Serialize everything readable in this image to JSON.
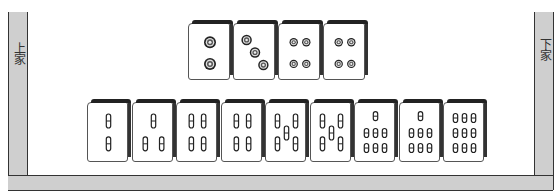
{
  "seats": {
    "left_label": "上家",
    "right_label": "下家"
  },
  "melded_tiles": [
    {
      "suit": "dots",
      "rank": 2
    },
    {
      "suit": "dots",
      "rank": 3
    },
    {
      "suit": "dots",
      "rank": 4
    },
    {
      "suit": "dots",
      "rank": 4
    }
  ],
  "hand_tiles": [
    {
      "suit": "bamboo",
      "rank": 2
    },
    {
      "suit": "bamboo",
      "rank": 3
    },
    {
      "suit": "bamboo",
      "rank": 4
    },
    {
      "suit": "bamboo",
      "rank": 4
    },
    {
      "suit": "bamboo",
      "rank": 5
    },
    {
      "suit": "bamboo",
      "rank": 5
    },
    {
      "suit": "bamboo",
      "rank": 7
    },
    {
      "suit": "bamboo",
      "rank": 7
    },
    {
      "suit": "bamboo",
      "rank": 9
    }
  ],
  "colors": {
    "frame": "#cfcfcf",
    "tile_face": "#ffffff",
    "tile_edge": "#222222",
    "pip": "#333333"
  }
}
